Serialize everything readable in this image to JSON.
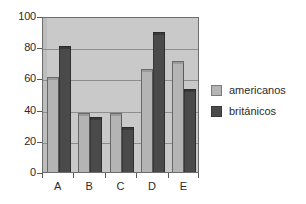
{
  "chart_data": {
    "type": "bar",
    "title": "",
    "subtitle": "",
    "xlabel": "",
    "ylabel": "",
    "categories": [
      "A",
      "B",
      "C",
      "D",
      "E"
    ],
    "series": [
      {
        "name": "americanos",
        "color": "#b4b4b4",
        "values": [
          61,
          38,
          38,
          66,
          71
        ]
      },
      {
        "name": "británicos",
        "color": "#4a4a4a",
        "values": [
          81,
          35,
          29,
          90,
          53
        ]
      }
    ],
    "ylim": [
      0,
      100
    ],
    "yticks": [
      0,
      20,
      40,
      60,
      80,
      100
    ],
    "ytick_labels": [
      "0",
      "20",
      "40",
      "60",
      "80",
      "100"
    ],
    "grid": true,
    "grid_axis": "y",
    "legend_position": "right",
    "plot_background": "#c9c9c9",
    "figure_background": "#ffffff",
    "style": "3d-bars"
  },
  "legend": {
    "items": [
      {
        "label": "americanos",
        "swatch": "light"
      },
      {
        "label": "británicos",
        "swatch": "dark"
      }
    ]
  }
}
